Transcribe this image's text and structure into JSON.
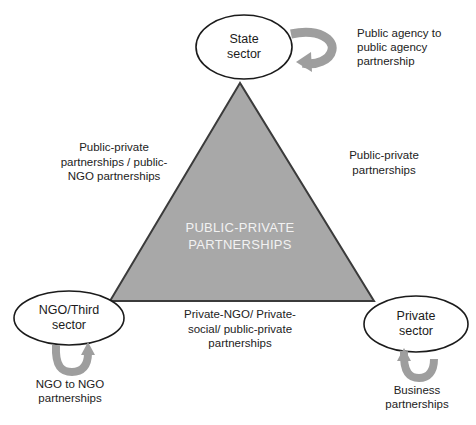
{
  "diagram": {
    "type": "triangle-relationship-diagram",
    "center_text": "PUBLIC-PRIVATE\nPARTNERSHIPS",
    "colors": {
      "triangle_fill": "#a8a8a8",
      "triangle_stroke": "#3b3b3b",
      "node_fill": "#ffffff",
      "node_stroke": "#1b1b1b",
      "loop_arrow": "#9a9a9a",
      "center_text": "#f2f2f2",
      "label_text": "#222222",
      "background": "#ffffff"
    },
    "nodes": [
      {
        "id": "state-sector",
        "label": "State\nsector",
        "position": "top"
      },
      {
        "id": "ngo-third-sector",
        "label": "NGO/Third\nsector",
        "position": "bottom-left"
      },
      {
        "id": "private-sector",
        "label": "Private\nsector",
        "position": "bottom-right"
      }
    ],
    "edge_labels": [
      {
        "id": "state-to-ngo",
        "text": "Public-private\npartnerships / public-\nNGO partnerships",
        "side": "left"
      },
      {
        "id": "state-to-private",
        "text": "Public-private\npartnerships",
        "side": "right"
      },
      {
        "id": "ngo-to-private",
        "text": "Private-NGO/ Private-\nsocial/ public-private\npartnerships",
        "side": "bottom"
      }
    ],
    "self_loops": [
      {
        "id": "state-self-loop",
        "icon": "loop-arrow-icon",
        "label": "Public agency to\npublic agency\npartnership"
      },
      {
        "id": "ngo-self-loop",
        "icon": "loop-arrow-icon",
        "label": "NGO to NGO\npartnerships"
      },
      {
        "id": "private-self-loop",
        "icon": "loop-arrow-icon",
        "label": "Business\npartnerships"
      }
    ]
  }
}
